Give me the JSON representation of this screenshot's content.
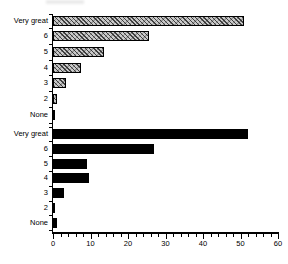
{
  "figure": {
    "background": "#ffffff",
    "title": ""
  },
  "chart_data": {
    "type": "bar",
    "orientation": "horizontal",
    "title": "",
    "xlabel": "",
    "ylabel": "",
    "categories": [
      "Very great",
      "6",
      "5",
      "4",
      "3",
      "2",
      "None"
    ],
    "series": [
      {
        "name": "upper-hatched",
        "style": "hatched",
        "values": [
          51,
          25.5,
          13.5,
          7.5,
          3.5,
          1,
          0.5
        ]
      },
      {
        "name": "lower-solid",
        "style": "solid",
        "values": [
          52,
          27,
          9,
          9.5,
          3,
          0.5,
          1
        ]
      }
    ],
    "xlim": [
      0,
      60
    ],
    "x_ticks": [
      0,
      10,
      20,
      30,
      40,
      50,
      60
    ],
    "x_tick_labels": [
      "0",
      "10",
      "20",
      "30",
      "40",
      "50",
      "60"
    ],
    "x_minor_tick_step": 2,
    "grid": false,
    "legend": "none",
    "colors": {
      "solid": "#000000",
      "hatch_bg": "#c9c9c9",
      "hatch_line": "#2a2a2a",
      "axis": "#000000",
      "text": "#000000"
    }
  }
}
